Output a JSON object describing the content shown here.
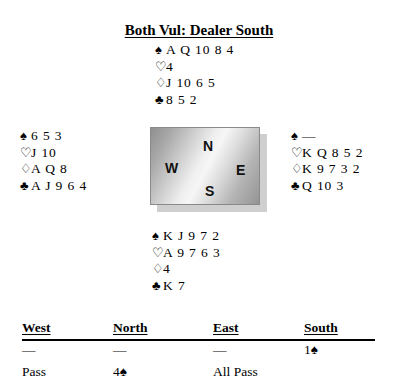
{
  "title": "Both Vul: Dealer South",
  "suits": {
    "spade": "♠",
    "heart": "♡",
    "diamond": "♢",
    "club": "♣"
  },
  "hands": {
    "north": {
      "label": "North",
      "spades": "A Q 10 8 4",
      "hearts": "4",
      "diamonds": "J 10 6 5",
      "clubs": "8 5 2"
    },
    "west": {
      "label": "West",
      "spades": "6 5 3",
      "hearts": "J 10",
      "diamonds": "A Q 8",
      "clubs": "A J 9 6 4"
    },
    "east": {
      "label": "East",
      "spades": "—",
      "hearts": "K Q 8 5 2",
      "diamonds": "K 9 7 3 2",
      "clubs": "Q 10 3"
    },
    "south": {
      "label": "South",
      "spades": "K J 9 7 2",
      "hearts": "A 9 7 6 3",
      "diamonds": "4",
      "clubs": "K 7"
    }
  },
  "compass": {
    "north": "N",
    "west": "W",
    "east": "E",
    "south": "S"
  },
  "auction": {
    "headers": {
      "west": "West",
      "north": "North",
      "east": "East",
      "south": "South"
    },
    "rows": [
      {
        "west": "—",
        "north": "—",
        "east": "—",
        "south": "1♠"
      },
      {
        "west": "Pass",
        "north": "4♠",
        "east": "All Pass",
        "south": ""
      }
    ]
  }
}
